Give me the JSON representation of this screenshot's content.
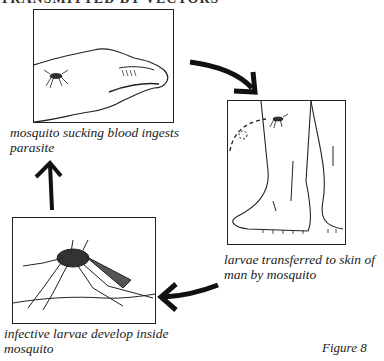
{
  "title": "TRANSMITTED BY VECTORS",
  "figure_label": "Figure 8",
  "panels": [
    {
      "id": "hand",
      "caption_line1": "mosquito sucking blood ingests",
      "caption_line2": "parasite"
    },
    {
      "id": "legs",
      "caption_line1": "larvae transferred to skin of",
      "caption_line2": "man by mosquito"
    },
    {
      "id": "mosquito",
      "caption_line1": "infective larvae develop inside",
      "caption_line2": "mosquito"
    }
  ],
  "arrows": [
    {
      "from": "hand",
      "to": "legs",
      "direction": "curved-down-right"
    },
    {
      "from": "legs",
      "to": "mosquito",
      "direction": "curved-left"
    },
    {
      "from": "mosquito",
      "to": "hand",
      "direction": "up"
    }
  ]
}
